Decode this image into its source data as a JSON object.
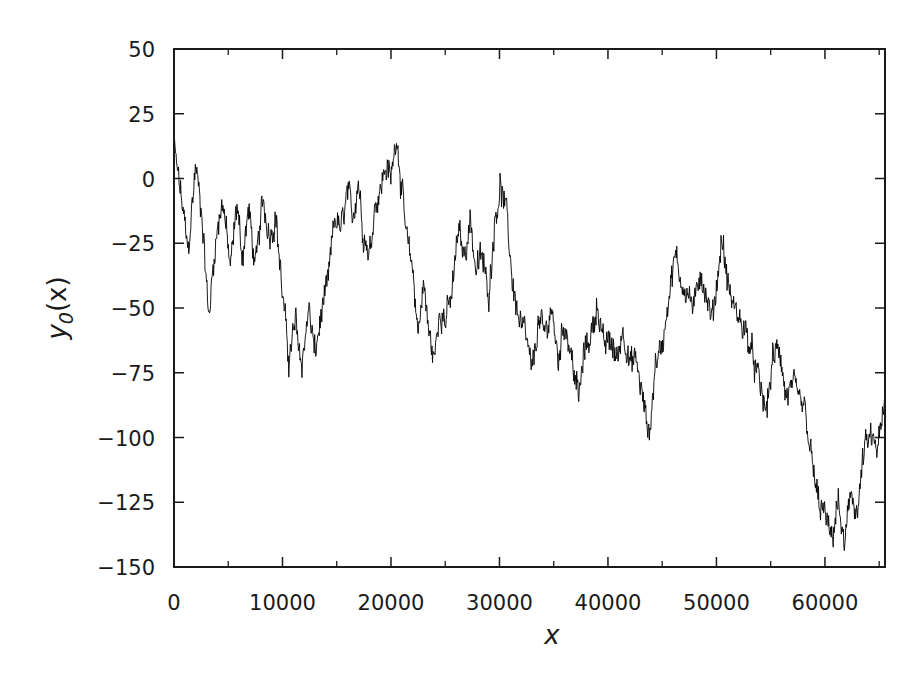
{
  "chart_data": {
    "type": "line",
    "title": "",
    "xlabel": "x",
    "ylabel": "y_0(x)",
    "ylabel_main": "y",
    "ylabel_sub": "0",
    "ylabel_arg": "(x)",
    "xlim": [
      0,
      65536
    ],
    "ylim": [
      -150,
      50
    ],
    "grid": false,
    "legend": null,
    "line_color": "#000000",
    "x_ticks": [
      0,
      10000,
      20000,
      30000,
      40000,
      50000,
      60000
    ],
    "x_tick_labels": [
      "0",
      "10000",
      "20000",
      "30000",
      "40000",
      "50000",
      "60000"
    ],
    "x_minor_ticks": [
      5000,
      15000,
      25000,
      35000,
      45000,
      55000,
      65000
    ],
    "y_ticks": [
      50,
      25,
      0,
      -25,
      -50,
      -75,
      -100,
      -125,
      -150
    ],
    "y_tick_labels": [
      "50",
      "25",
      "0",
      "−25",
      "−50",
      "−75",
      "−100",
      "−125",
      "−150"
    ],
    "series": [
      {
        "name": "y_0(x)",
        "description": "random-walk-like trajectory (approximate key points read from figure)",
        "x": [
          0,
          600,
          1300,
          2000,
          2600,
          3200,
          3800,
          4500,
          5200,
          5800,
          6300,
          6900,
          7500,
          8200,
          8800,
          9400,
          10000,
          10600,
          11200,
          11800,
          12400,
          13000,
          13600,
          14200,
          14800,
          15400,
          16000,
          16500,
          17000,
          17400,
          18000,
          18500,
          19000,
          19500,
          20000,
          20500,
          21000,
          21500,
          22000,
          22500,
          23000,
          23500,
          24000,
          24500,
          25000,
          25600,
          26200,
          26800,
          27300,
          27800,
          28400,
          29000,
          29600,
          30100,
          30700,
          31200,
          31800,
          32400,
          33000,
          33600,
          34200,
          34800,
          35400,
          36000,
          36700,
          37300,
          37900,
          38500,
          39000,
          39600,
          40200,
          40800,
          41400,
          42000,
          42600,
          43200,
          43800,
          44400,
          45000,
          45600,
          46200,
          46800,
          47400,
          48000,
          48500,
          49000,
          49600,
          50200,
          50500,
          51000,
          51600,
          52200,
          52800,
          53400,
          54000,
          54600,
          55200,
          55800,
          56400,
          57000,
          57600,
          58200,
          58800,
          59400,
          60000,
          60600,
          61200,
          61800,
          62400,
          63000,
          63600,
          64200,
          64800,
          65536
        ],
        "values": [
          12,
          -5,
          -28,
          5,
          -15,
          -54,
          -25,
          -8,
          -35,
          -10,
          -30,
          -12,
          -35,
          -8,
          -22,
          -15,
          -45,
          -70,
          -55,
          -72,
          -50,
          -68,
          -52,
          -40,
          -15,
          -20,
          -5,
          -15,
          0,
          -20,
          -30,
          -10,
          -5,
          5,
          0,
          18,
          -5,
          -25,
          -35,
          -60,
          -40,
          -60,
          -70,
          -50,
          -55,
          -45,
          -20,
          -30,
          -15,
          -35,
          -30,
          -45,
          -15,
          -3,
          -15,
          -40,
          -55,
          -60,
          -75,
          -55,
          -60,
          -50,
          -70,
          -55,
          -70,
          -85,
          -65,
          -60,
          -48,
          -65,
          -62,
          -70,
          -58,
          -72,
          -70,
          -85,
          -100,
          -70,
          -65,
          -45,
          -30,
          -40,
          -45,
          -50,
          -35,
          -45,
          -55,
          -35,
          -22,
          -40,
          -50,
          -55,
          -60,
          -70,
          -80,
          -90,
          -70,
          -65,
          -85,
          -80,
          -85,
          -90,
          -110,
          -125,
          -130,
          -140,
          -125,
          -143,
          -120,
          -130,
          -105,
          -100,
          -105,
          -88
        ]
      }
    ]
  }
}
